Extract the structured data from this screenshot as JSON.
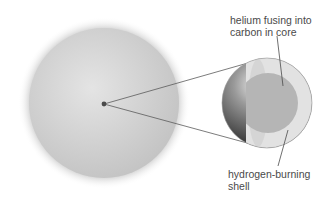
{
  "diagram": {
    "labels": {
      "core": "helium fusing into\ncarbon in core",
      "shell": "hydrogen-burning\nshell"
    },
    "colors": {
      "star_outer": "#c9c9c9",
      "star_center": "#e6e6e6",
      "core_dot": "#4a4a4a",
      "sphere_dark": "#3a3a3a",
      "sphere_light": "#d8d8d8",
      "shell_cut": "#e3e3e3",
      "core_cut": "#b4b4b4",
      "line": "#5a5a5a",
      "text": "#4a4a4a"
    }
  }
}
